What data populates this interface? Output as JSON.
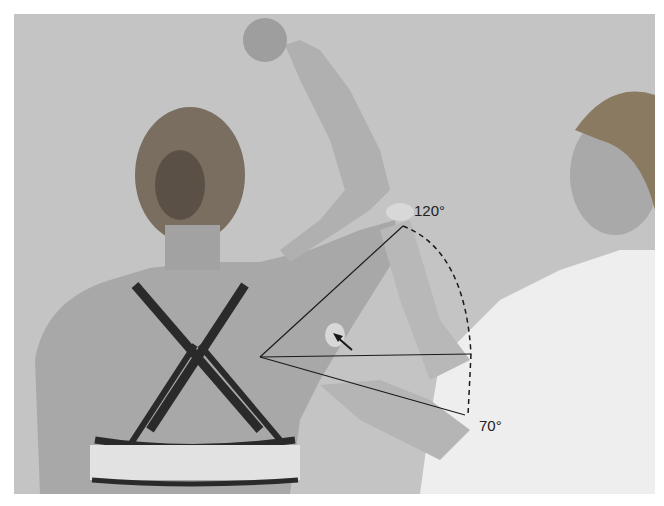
{
  "figure": {
    "annotations": {
      "upper_angle": "120°",
      "lower_angle": "70°"
    },
    "colors": {
      "background_wall": "#c4c4c4",
      "skin": "#a6a6a6",
      "shirt": "#ececec",
      "bra_straps": "#2a2a2a",
      "overlay_lines": "#1a1a1a"
    }
  }
}
